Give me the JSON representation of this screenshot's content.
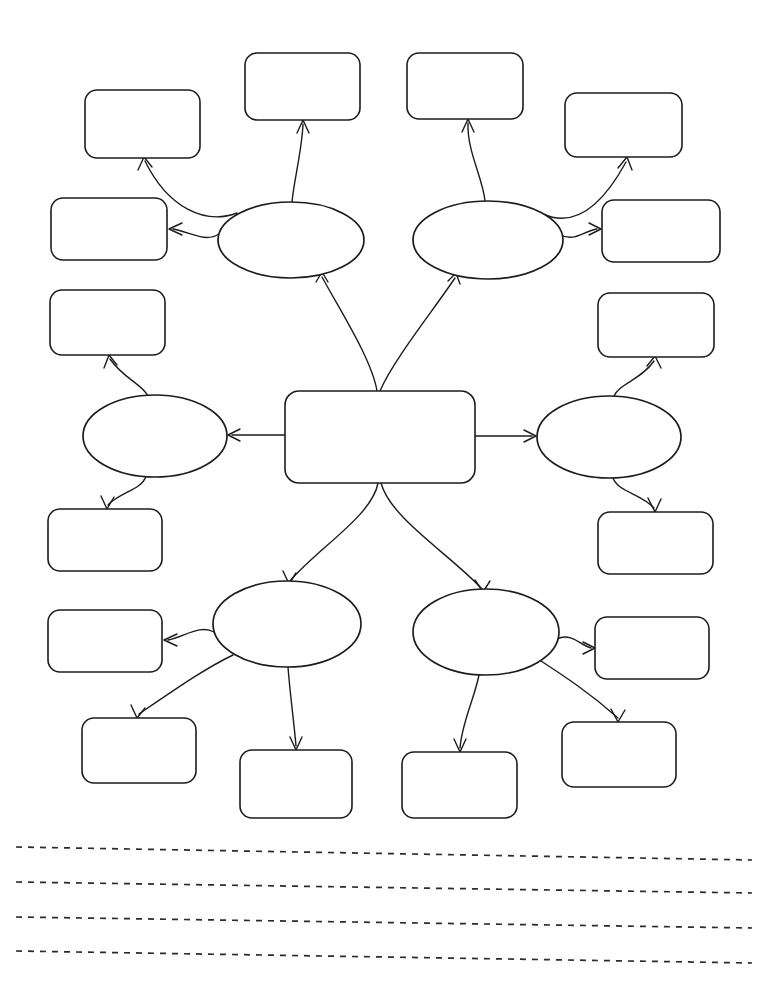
{
  "page": {
    "background_color": "#ffffff",
    "ink_color": "#1c1c1c",
    "width": 768,
    "height": 1007
  },
  "diagram": {
    "type": "concept-map",
    "center": {
      "id": "center-topic",
      "label": "",
      "shape": "rounded-rectangle",
      "x": 285,
      "y": 391,
      "width": 190,
      "height": 92
    },
    "ellipses": [
      {
        "id": "ellipse-top-left",
        "label": "",
        "cx": 291,
        "cy": 240,
        "rx": 73,
        "ry": 38
      },
      {
        "id": "ellipse-top-right",
        "label": "",
        "cx": 488,
        "cy": 240,
        "rx": 75,
        "ry": 39
      },
      {
        "id": "ellipse-middle-left",
        "label": "",
        "cx": 155,
        "cy": 436,
        "rx": 72,
        "ry": 41
      },
      {
        "id": "ellipse-middle-right",
        "label": "",
        "cx": 609,
        "cy": 437,
        "rx": 72,
        "ry": 41
      },
      {
        "id": "ellipse-bottom-left",
        "label": "",
        "cx": 287,
        "cy": 624,
        "rx": 74,
        "ry": 43
      },
      {
        "id": "ellipse-bottom-right",
        "label": "",
        "cx": 486,
        "cy": 632,
        "rx": 73,
        "ry": 43
      }
    ],
    "boxes": [
      {
        "id": "box-top-far-left",
        "label": "",
        "x": 85,
        "y": 90,
        "width": 115,
        "height": 68,
        "parent": "ellipse-top-left"
      },
      {
        "id": "box-top-center-left",
        "label": "",
        "x": 245,
        "y": 53,
        "width": 115,
        "height": 67,
        "parent": "ellipse-top-left"
      },
      {
        "id": "box-left-upper",
        "label": "",
        "x": 51,
        "y": 198,
        "width": 116,
        "height": 62,
        "parent": "ellipse-top-left"
      },
      {
        "id": "box-top-center-right",
        "label": "",
        "x": 407,
        "y": 53,
        "width": 116,
        "height": 66,
        "parent": "ellipse-top-right"
      },
      {
        "id": "box-top-far-right",
        "label": "",
        "x": 565,
        "y": 93,
        "width": 117,
        "height": 64,
        "parent": "ellipse-top-right"
      },
      {
        "id": "box-right-upper",
        "label": "",
        "x": 602,
        "y": 200,
        "width": 118,
        "height": 62,
        "parent": "ellipse-top-right"
      },
      {
        "id": "box-left-middle-upper",
        "label": "",
        "x": 50,
        "y": 290,
        "width": 115,
        "height": 65,
        "parent": "ellipse-middle-left"
      },
      {
        "id": "box-left-middle-lower",
        "label": "",
        "x": 48,
        "y": 509,
        "width": 114,
        "height": 62,
        "parent": "ellipse-middle-left"
      },
      {
        "id": "box-right-middle-upper",
        "label": "",
        "x": 598,
        "y": 293,
        "width": 116,
        "height": 64,
        "parent": "ellipse-middle-right"
      },
      {
        "id": "box-right-middle-lower",
        "label": "",
        "x": 598,
        "y": 512,
        "width": 115,
        "height": 62,
        "parent": "ellipse-middle-right"
      },
      {
        "id": "box-left-lower",
        "label": "",
        "x": 48,
        "y": 610,
        "width": 114,
        "height": 62,
        "parent": "ellipse-bottom-left"
      },
      {
        "id": "box-bottom-far-left",
        "label": "",
        "x": 82,
        "y": 718,
        "width": 114,
        "height": 65,
        "parent": "ellipse-bottom-left"
      },
      {
        "id": "box-bottom-center-left",
        "label": "",
        "x": 240,
        "y": 750,
        "width": 112,
        "height": 68,
        "parent": "ellipse-bottom-left"
      },
      {
        "id": "box-bottom-center-right",
        "label": "",
        "x": 402,
        "y": 752,
        "width": 115,
        "height": 66,
        "parent": "ellipse-bottom-right"
      },
      {
        "id": "box-right-lower",
        "label": "",
        "x": 595,
        "y": 617,
        "width": 114,
        "height": 62,
        "parent": "ellipse-bottom-right"
      },
      {
        "id": "box-bottom-far-right",
        "label": "",
        "x": 562,
        "y": 722,
        "width": 114,
        "height": 65,
        "parent": "ellipse-bottom-right"
      }
    ],
    "connectors": [
      {
        "id": "center-to-top-left",
        "from": "center-topic",
        "to": "ellipse-top-left",
        "path": "M 377 391 C 372 360, 340 310, 322 277",
        "arrow": "M 316 282 L 322 272 L 328 282"
      },
      {
        "id": "center-to-top-right",
        "from": "center-topic",
        "to": "ellipse-top-right",
        "path": "M 380 391 C 392 362, 432 312, 455 278",
        "arrow": "M 448 281 L 456 273 L 460 284"
      },
      {
        "id": "center-to-middle-left",
        "from": "center-topic",
        "to": "ellipse-middle-left",
        "path": "M 285 435 L 232 435",
        "arrow": "M 240 429 L 228 435 L 240 441"
      },
      {
        "id": "center-to-middle-right",
        "from": "center-topic",
        "to": "ellipse-middle-right",
        "path": "M 475 436 L 532 436",
        "arrow": "M 524 430 L 536 436 L 524 442"
      },
      {
        "id": "center-to-bottom-left",
        "from": "center-topic",
        "to": "ellipse-bottom-left",
        "path": "M 378 483 C 372 516, 318 548, 290 581",
        "arrow": "M 283 571 L 289 584 L 296 573"
      },
      {
        "id": "center-to-bottom-right",
        "from": "center-topic",
        "to": "ellipse-bottom-right",
        "path": "M 381 483 C 390 518, 452 556, 482 589",
        "arrow": "M 475 580 L 483 592 L 490 581"
      },
      {
        "id": "top-left-to-box-far-left",
        "from": "ellipse-top-left",
        "to": "box-top-far-left",
        "path": "M 237 213 C 205 225, 168 208, 145 161",
        "arrow": "M 138 170 L 144 157 L 152 167"
      },
      {
        "id": "top-left-to-box-center",
        "from": "ellipse-top-left",
        "to": "box-top-center-left",
        "path": "M 292 202 C 294 180, 302 150, 303 124",
        "arrow": "M 297 133 L 303 120 L 309 133"
      },
      {
        "id": "top-left-to-left-box",
        "from": "ellipse-top-left",
        "to": "box-left-upper",
        "path": "M 219 234 C 205 243, 190 232, 173 229",
        "arrow": "M 182 223 L 169 229 L 182 235"
      },
      {
        "id": "top-right-to-box-center",
        "from": "ellipse-top-right",
        "to": "box-top-center-right",
        "path": "M 485 201 C 483 178, 467 152, 468 123",
        "arrow": "M 462 132 L 468 119 L 474 132"
      },
      {
        "id": "top-right-to-box-far-right",
        "from": "ellipse-top-right",
        "to": "box-top-far-right",
        "path": "M 543 214 C 574 228, 602 206, 626 162",
        "arrow": "M 618 168 L 627 157 L 632 170"
      },
      {
        "id": "top-right-to-right-box",
        "from": "ellipse-top-right",
        "to": "box-right-upper",
        "path": "M 559 234 C 574 243, 583 231, 597 229",
        "arrow": "M 589 223 L 601 229 L 589 235"
      },
      {
        "id": "middle-left-to-upper-box",
        "from": "ellipse-middle-left",
        "to": "box-left-middle-upper",
        "path": "M 148 396 C 142 384, 124 379, 110 359",
        "arrow": "M 104 368 L 109 355 L 117 365"
      },
      {
        "id": "middle-left-to-lower-box",
        "from": "ellipse-middle-left",
        "to": "box-left-middle-lower",
        "path": "M 146 476 C 142 490, 120 492, 108 505",
        "arrow": "M 101 496 L 107 509 L 114 497"
      },
      {
        "id": "middle-right-to-upper-box",
        "from": "ellipse-middle-right",
        "to": "box-right-middle-upper",
        "path": "M 614 396 C 620 383, 641 380, 654 361",
        "arrow": "M 647 366 L 655 356 L 661 368"
      },
      {
        "id": "middle-right-to-lower-box",
        "from": "ellipse-middle-right",
        "to": "box-right-middle-lower",
        "path": "M 613 478 C 618 492, 642 494, 654 508",
        "arrow": "M 648 498 L 655 512 L 661 499"
      },
      {
        "id": "bottom-left-to-left-box",
        "from": "ellipse-bottom-left",
        "to": "box-left-lower",
        "path": "M 214 632 C 200 624, 184 637, 168 640",
        "arrow": "M 177 634 L 164 640 L 177 646"
      },
      {
        "id": "bottom-left-to-far-left-box",
        "from": "ellipse-bottom-left",
        "to": "box-bottom-far-left",
        "path": "M 233 655 C 206 668, 180 686, 139 714",
        "arrow": "M 131 705 L 137 718 L 145 708"
      },
      {
        "id": "bottom-left-to-center-box",
        "from": "ellipse-bottom-left",
        "to": "box-bottom-center-left",
        "path": "M 288 667 C 290 694, 294 722, 296 746",
        "arrow": "M 290 737 L 296 750 L 302 737"
      },
      {
        "id": "bottom-right-to-center-box",
        "from": "ellipse-bottom-right",
        "to": "box-bottom-center-right",
        "path": "M 479 675 C 474 700, 462 722, 460 748",
        "arrow": "M 454 739 L 460 752 L 466 739"
      },
      {
        "id": "bottom-right-to-right-box",
        "from": "ellipse-bottom-right",
        "to": "box-right-lower",
        "path": "M 557 639 C 571 632, 580 645, 591 648",
        "arrow": "M 583 642 L 595 648 L 583 654"
      },
      {
        "id": "bottom-right-to-far-right-box",
        "from": "ellipse-bottom-right",
        "to": "box-bottom-far-right",
        "path": "M 541 661 C 564 676, 590 693, 618 718",
        "arrow": "M 611 709 L 618 722 L 625 710"
      }
    ]
  },
  "writing_lines": {
    "count": 4,
    "style": "dashed",
    "lines": [
      {
        "id": "writing-line-1",
        "path": "M 16 847 L 752 860"
      },
      {
        "id": "writing-line-2",
        "path": "M 16 882 L 752 893"
      },
      {
        "id": "writing-line-3",
        "path": "M 16 917 L 752 928"
      },
      {
        "id": "writing-line-4",
        "path": "M 16 951 L 752 963"
      }
    ]
  }
}
